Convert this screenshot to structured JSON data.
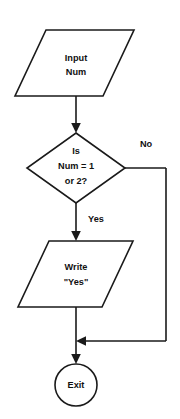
{
  "diagram": {
    "type": "flowchart",
    "background_color": "#ffffff",
    "line_color": "#1a1a1a",
    "text_color": "#111111",
    "nodes": [
      {
        "id": "input",
        "shape": "parallelogram",
        "role": "input-output",
        "lines": [
          "Input",
          "Num"
        ],
        "line1": "Input",
        "line2": "Num"
      },
      {
        "id": "decision",
        "shape": "diamond",
        "role": "decision",
        "lines": [
          "Is",
          "Num = 1",
          "or 2?"
        ],
        "line1": "Is",
        "line2": "Num = 1",
        "line3": "or 2?"
      },
      {
        "id": "write",
        "shape": "parallelogram",
        "role": "input-output",
        "lines": [
          "Write",
          "\"Yes\""
        ],
        "line1": "Write",
        "line2": "\"Yes\""
      },
      {
        "id": "exit",
        "shape": "circle",
        "role": "terminator",
        "lines": [
          "Exit"
        ],
        "line1": "Exit"
      }
    ],
    "edges": [
      {
        "id": "input-to-decision",
        "from": "input",
        "to": "decision",
        "label": ""
      },
      {
        "id": "decision-yes",
        "from": "decision",
        "to": "write",
        "label": "Yes"
      },
      {
        "id": "decision-no",
        "from": "decision",
        "to": "exit",
        "label": "No"
      },
      {
        "id": "write-to-exit",
        "from": "write",
        "to": "exit",
        "label": ""
      }
    ],
    "labels": {
      "yes": "Yes",
      "no": "No"
    }
  }
}
